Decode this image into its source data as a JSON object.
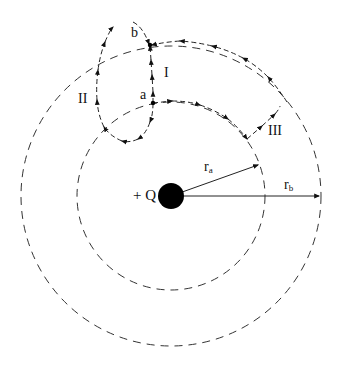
{
  "diagram": {
    "charge": {
      "label": "+ Q",
      "center": [
        171,
        196
      ],
      "radius": 13,
      "color": "#000000"
    },
    "equipotentials": [
      {
        "name": "r_a",
        "label_main": "r",
        "label_sub": "a",
        "radius": 94
      },
      {
        "name": "r_b",
        "label_main": "r",
        "label_sub": "b",
        "radius": 150
      }
    ],
    "points": [
      {
        "name": "a",
        "label": "a",
        "x": 153,
        "y": 103
      },
      {
        "name": "b",
        "label": "b",
        "x": 150,
        "y": 45
      }
    ],
    "paths": [
      {
        "name": "I",
        "label": "I",
        "from": "a",
        "to": "b"
      },
      {
        "name": "II",
        "label": "II",
        "from": "a",
        "to": "b"
      },
      {
        "name": "III",
        "label": "III",
        "from": "a",
        "to": "b"
      }
    ],
    "stroke_color": "#333333"
  }
}
